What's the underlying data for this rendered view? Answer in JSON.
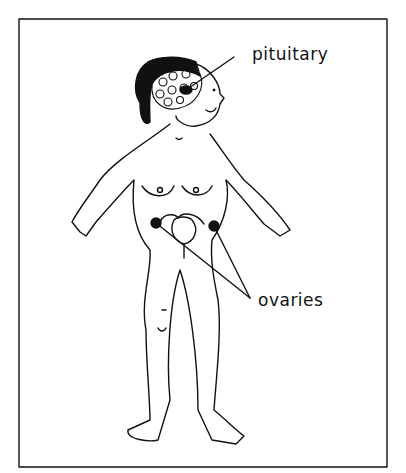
{
  "diagram": {
    "labels": {
      "pituitary": "pituitary",
      "ovaries": "ovaries"
    },
    "colors": {
      "line": "#111111",
      "background": "#ffffff"
    }
  }
}
